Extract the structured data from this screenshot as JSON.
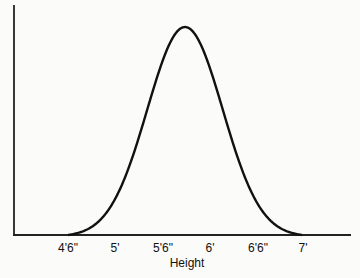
{
  "chart_data": {
    "type": "line",
    "title": "",
    "xlabel": "Height",
    "ylabel": "",
    "categories": [
      "4'6\"",
      "5'",
      "5'6\"",
      "6'",
      "6'6\"",
      "7'"
    ],
    "x_inches": [
      54,
      60,
      66,
      72,
      78,
      84
    ],
    "peak_x": "5'9\"",
    "grid": false,
    "legend": "none",
    "xlim": [
      "4'6\"",
      "7'"
    ]
  },
  "axis": {
    "ticks": [
      "4'6\"",
      "5'",
      "5'6\"",
      "6'",
      "6'6\"",
      "7'"
    ],
    "xlabel": "Height"
  }
}
